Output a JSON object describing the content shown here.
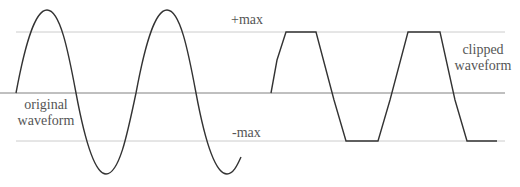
{
  "labels": {
    "plus_max": "+max",
    "minus_max": "-max",
    "original": [
      "original",
      "waveform"
    ],
    "clipped": [
      "clipped",
      "waveform"
    ]
  },
  "colors": {
    "waveform": "#333333",
    "guide": "#c8c8c8",
    "axis": "#777777",
    "text": "#555555"
  }
}
